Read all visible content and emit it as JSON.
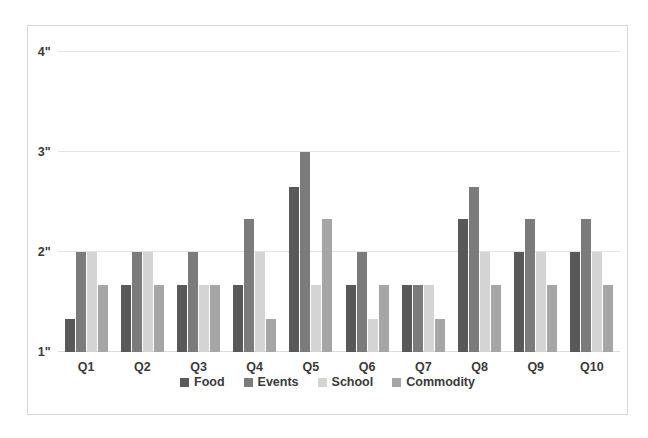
{
  "chart_data": {
    "type": "bar",
    "title": "",
    "subtitle": "",
    "xlabel": "",
    "ylabel": "",
    "categories": [
      "Q1",
      "Q2",
      "Q3",
      "Q4",
      "Q5",
      "Q6",
      "Q7",
      "Q8",
      "Q9",
      "Q10"
    ],
    "ylim": [
      1,
      4
    ],
    "yticks": [
      1,
      2,
      3,
      4
    ],
    "ytick_labels": [
      "1\"",
      "2\"",
      "3\"",
      "4\""
    ],
    "grid": true,
    "legend_position": "bottom",
    "series": [
      {
        "name": "Food",
        "color": "#595959",
        "values": [
          1.33,
          1.67,
          1.67,
          1.67,
          2.65,
          1.67,
          1.67,
          2.33,
          2.0,
          2.0
        ]
      },
      {
        "name": "Events",
        "color": "#7b7b7b",
        "values": [
          2.0,
          2.0,
          2.0,
          2.33,
          3.0,
          2.0,
          1.67,
          2.65,
          2.33,
          2.33
        ]
      },
      {
        "name": "School",
        "color": "#d4d4d4",
        "values": [
          2.0,
          2.0,
          1.67,
          2.0,
          1.67,
          1.33,
          1.67,
          2.0,
          2.0,
          2.0
        ]
      },
      {
        "name": "Commodity",
        "color": "#a6a6a6",
        "values": [
          1.67,
          1.67,
          1.67,
          1.33,
          2.33,
          1.67,
          1.33,
          1.67,
          1.67,
          1.67
        ]
      }
    ]
  }
}
